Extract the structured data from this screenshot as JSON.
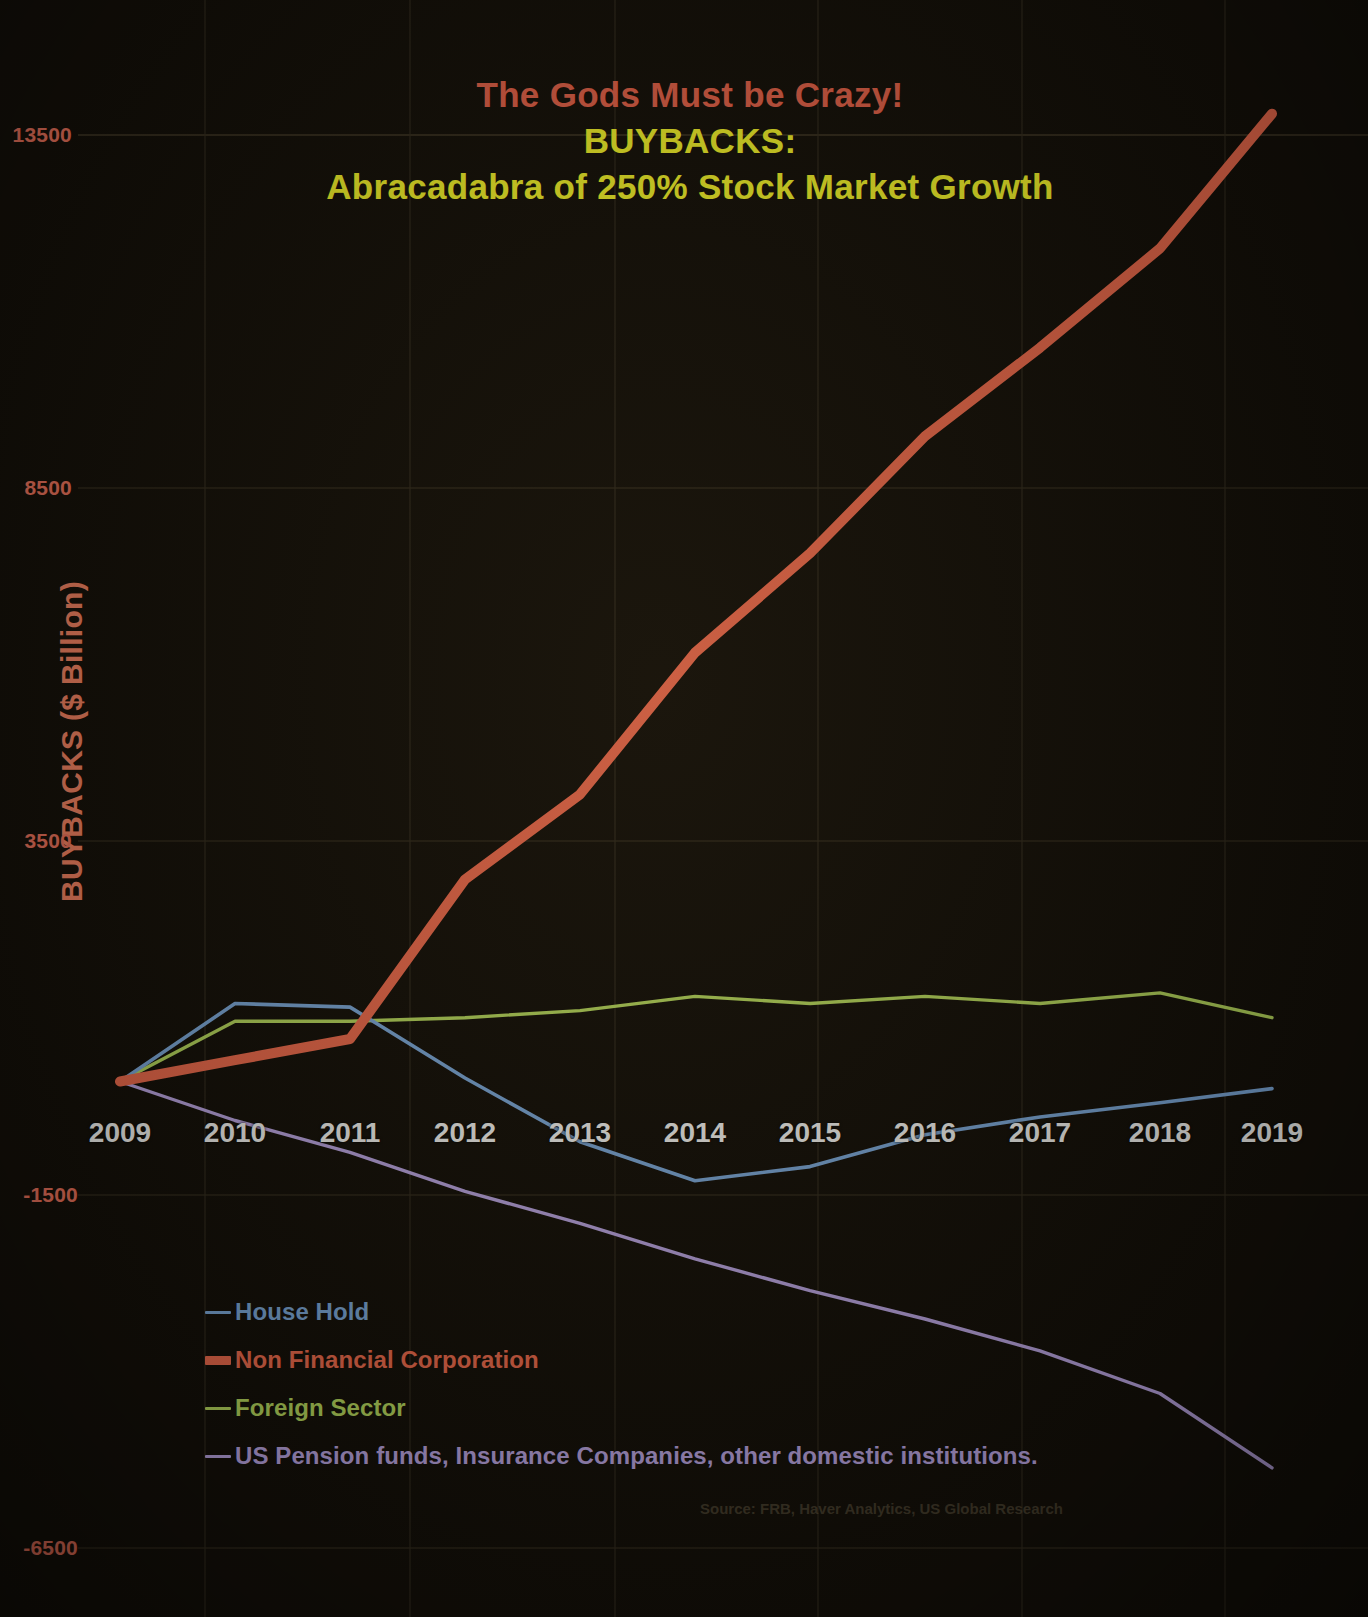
{
  "title": {
    "line1": "The Gods Must be Crazy!",
    "line2": "BUYBACKS:",
    "line3": "Abracadabra of 250% Stock Market Growth",
    "color_line1": "#e8634a",
    "color_line2": "#f5f52a"
  },
  "axes": {
    "ytitle": "BUYBACKS ($ Billion)",
    "ytitle_color": "#f08060",
    "ytick_color": "#e8705a",
    "xtick_color": "#f2f2ef",
    "yticks": [
      "13500",
      "8500",
      "3500",
      "-1500",
      "-6500"
    ],
    "xticks": [
      "2009",
      "2010",
      "2011",
      "2012",
      "2013",
      "2014",
      "2015",
      "2016",
      "2017",
      "2018",
      "2019"
    ]
  },
  "legend": [
    {
      "label": "House Hold",
      "color": "#7ba7d7",
      "width": 3
    },
    {
      "label": "Non Financial Corporation",
      "color": "#ec6a4c",
      "width": 9
    },
    {
      "label": "Foreign Sector",
      "color": "#b5d65c",
      "width": 3
    },
    {
      "label": "US Pension funds, Insurance Companies, other domestic institutions.",
      "color": "#b9a4e0",
      "width": 3
    }
  ],
  "source": "Source: FRB, Haver Analytics, US Global Research",
  "chart_data": {
    "type": "line",
    "title": "The Gods Must be Crazy! BUYBACKS: Abracadabra of 250% Stock Market Growth",
    "xlabel": "",
    "ylabel": "BUYBACKS ($ Billion)",
    "x": [
      2009,
      2010,
      2011,
      2012,
      2013,
      2014,
      2015,
      2016,
      2017,
      2018,
      2019
    ],
    "ylim": [
      -6500,
      13500
    ],
    "ytick_values": [
      13500,
      8500,
      3500,
      -1500,
      -6500
    ],
    "grid": true,
    "legend_position": "bottom-left",
    "series": [
      {
        "name": "House Hold",
        "color": "#7ba7d7",
        "values": [
          150,
          1250,
          1200,
          200,
          -700,
          -1250,
          -1050,
          -600,
          -350,
          -150,
          50
        ]
      },
      {
        "name": "Non Financial Corporation",
        "color": "#ec6a4c",
        "values": [
          150,
          450,
          750,
          3000,
          4200,
          6200,
          7600,
          9250,
          10500,
          11900,
          13800
        ]
      },
      {
        "name": "Foreign Sector",
        "color": "#b5d65c",
        "values": [
          150,
          1000,
          1000,
          1050,
          1150,
          1350,
          1250,
          1350,
          1250,
          1400,
          1050
        ]
      },
      {
        "name": "US Pension funds, Insurance Companies, other domestic institutions.",
        "color": "#b9a4e0",
        "values": [
          150,
          -400,
          -850,
          -1400,
          -1850,
          -2350,
          -2800,
          -3200,
          -3650,
          -4250,
          -5300
        ]
      }
    ]
  },
  "plot_geometry": {
    "x_px": [
      120,
      235,
      350,
      465,
      580,
      695,
      810,
      925,
      1040,
      1160,
      1272
    ],
    "y_top_px": 135,
    "y_top_val": 13500,
    "px_per_unit": 0.0709,
    "gridline_y_px": [
      135,
      488,
      841,
      1195,
      1548
    ],
    "gridline_x_px": [
      205,
      410,
      615,
      818,
      1022,
      1225
    ]
  }
}
